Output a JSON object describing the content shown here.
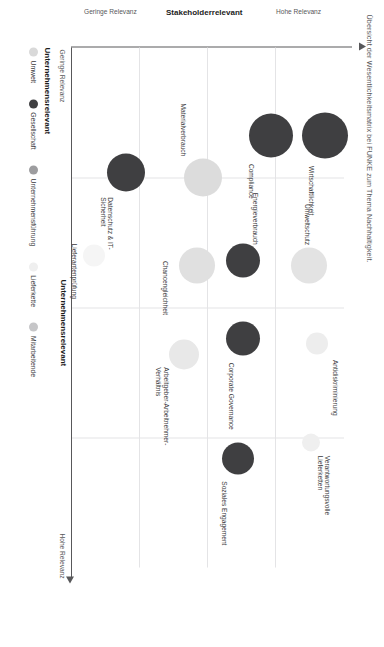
{
  "title": "Übersicht der Wesentlichkeitsmatrix bei FUNKE zum Thema Nachhaltigkeit.",
  "axes": {
    "x_title": "Unternehmensrelevant",
    "x_low": "Geringe Relevanz",
    "x_high": "Hohe Relevanz",
    "y_title": "Stakeholderrelevant",
    "y_low": "Geringe Relevanz",
    "y_high": "Hohe Relevanz"
  },
  "legend": {
    "title": "Unternehmensrelevant",
    "items": [
      {
        "label": "Umwelt",
        "color": "#d9d9d9"
      },
      {
        "label": "Gesellschaft",
        "color": "#3f3f41"
      },
      {
        "label": "Unternehmensführung",
        "color": "#9d9d9f"
      },
      {
        "label": "Lieferkette",
        "color": "#efefef"
      },
      {
        "label": "Mitarbeitende",
        "color": "#c6c6c8"
      }
    ]
  },
  "chart_data": {
    "type": "scatter",
    "title": "Übersicht der Wesentlichkeitsmatrix bei FUNKE zum Thema Nachhaltigkeit.",
    "xlabel": "Unternehmensrelevant",
    "ylabel": "Stakeholderrelevant",
    "xlim": [
      0,
      100
    ],
    "ylim": [
      0,
      100
    ],
    "grid": true,
    "legend_position": "below-plot",
    "legend_entries": [
      "Umwelt",
      "Gesellschaft",
      "Unternehmensführung",
      "Lieferkette",
      "Mitarbeitende"
    ],
    "points": [
      {
        "label": "Wirtschaftlichkeit",
        "x": 17,
        "y": 93,
        "size": 46,
        "color": "#3f3f41",
        "category": "Unternehmensführung"
      },
      {
        "label": "Compliance",
        "x": 17,
        "y": 73,
        "size": 44,
        "color": "#3f3f41",
        "category": "Unternehmensführung"
      },
      {
        "label": "Umweltschutz",
        "x": 42,
        "y": 87,
        "size": 36,
        "color": "#e3e3e3",
        "category": "Umwelt"
      },
      {
        "label": "Antidiskriminierung",
        "x": 57,
        "y": 90,
        "size": 22,
        "color": "#ededed",
        "category": "Mitarbeitende"
      },
      {
        "label": "Verantwortungsvolle\nLieferketten",
        "x": 76,
        "y": 88,
        "size": 18,
        "color": "#efefef",
        "category": "Lieferkette"
      },
      {
        "label": "Energieverbrauch",
        "x": 41,
        "y": 63,
        "size": 34,
        "color": "#3f3f41",
        "category": "Umwelt"
      },
      {
        "label": "Corporate Governance",
        "x": 56,
        "y": 63,
        "size": 34,
        "color": "#3f3f41",
        "category": "Unternehmensführung"
      },
      {
        "label": "Soziales Engagement",
        "x": 79,
        "y": 61,
        "size": 32,
        "color": "#3f3f41",
        "category": "Gesellschaft"
      },
      {
        "label": "Materialverbrauch",
        "x": 25,
        "y": 48,
        "size": 38,
        "color": "#dcdcdc",
        "category": "Umwelt"
      },
      {
        "label": "Chancengleichheit",
        "x": 42,
        "y": 46,
        "size": 36,
        "color": "#e0e0e0",
        "category": "Mitarbeitende"
      },
      {
        "label": "Arbeitgeber-Arbeitnehmer-\nVerhältnis",
        "x": 59,
        "y": 41,
        "size": 30,
        "color": "#e8e8e8",
        "category": "Mitarbeitende"
      },
      {
        "label": "Datenschutz & IT-\nSicherheit",
        "x": 24,
        "y": 20,
        "size": 38,
        "color": "#3f3f41",
        "category": "Unternehmensführung"
      },
      {
        "label": "Lieferantenprüfung",
        "x": 40,
        "y": 8,
        "size": 22,
        "color": "#f5f5f5",
        "category": "Lieferkette"
      }
    ]
  }
}
